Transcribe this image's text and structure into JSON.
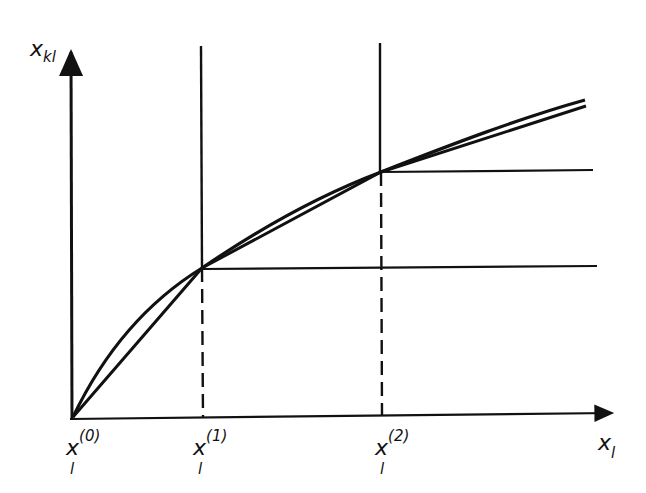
{
  "diagram": {
    "type": "piecewise-linear approximation of concave function",
    "y_axis_label": {
      "main": "x",
      "sub": "kl"
    },
    "x_axis_label": {
      "main": "x",
      "sub": "l"
    },
    "breakpoints": [
      {
        "main": "x",
        "sub": "l",
        "sup": "(0)"
      },
      {
        "main": "x",
        "sub": "l",
        "sup": "(1)"
      },
      {
        "main": "x",
        "sub": "l",
        "sup": "(2)"
      }
    ],
    "colors": {
      "ink": "#111111",
      "background": "#ffffff"
    }
  }
}
